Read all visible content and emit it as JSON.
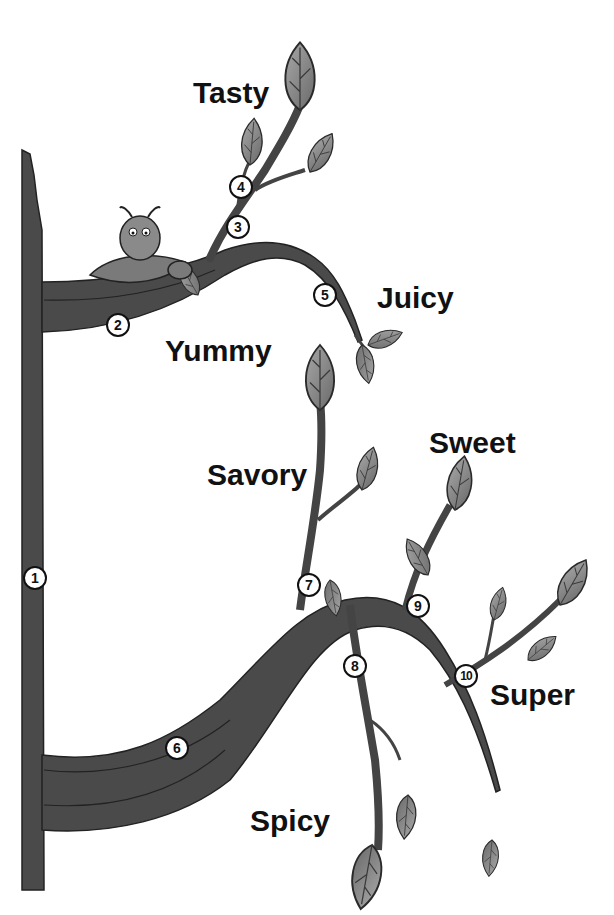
{
  "diagram": {
    "type": "branching vine / tree",
    "colors": {
      "stem": "#4a4a4a",
      "stem_dark": "#222222",
      "leaf": "#8a8a8a",
      "leaf_vein": "#3a3a3a",
      "background": "#ffffff",
      "label_text": "#111111"
    },
    "labels": {
      "tasty": "Tasty",
      "juicy": "Juicy",
      "yummy": "Yummy",
      "savory": "Savory",
      "sweet": "Sweet",
      "super": "Super",
      "spicy": "Spicy"
    },
    "nodes": [
      "1",
      "2",
      "3",
      "4",
      "5",
      "6",
      "7",
      "8",
      "9",
      "10"
    ],
    "character": "caterpillar on leaf"
  }
}
